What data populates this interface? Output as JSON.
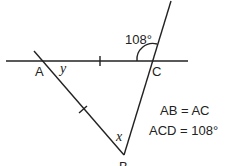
{
  "diagram": {
    "points": {
      "A": "A",
      "B": "B",
      "C": "C"
    },
    "angles": {
      "exterior": "108°",
      "at_A": "y",
      "at_B": "x"
    },
    "facts": [
      "AB = AC",
      "ACD = 108°"
    ]
  }
}
